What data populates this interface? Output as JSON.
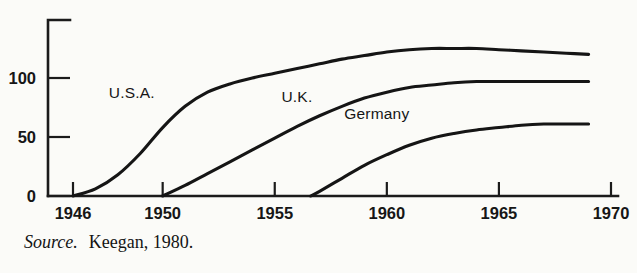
{
  "figure": {
    "source_note": {
      "label": "Source.",
      "citation": "Keegan, 1980."
    }
  },
  "chart_data": {
    "type": "line",
    "title": "",
    "xlabel": "",
    "ylabel": "",
    "xlim": [
      1946,
      1970
    ],
    "ylim": [
      0,
      130
    ],
    "xticks": [
      1946,
      1950,
      1955,
      1960,
      1965,
      1970
    ],
    "xticklabels": [
      "1946",
      "1950",
      "1955",
      "1960",
      "1965",
      "1970"
    ],
    "yticks": [
      0,
      50,
      100
    ],
    "yticklabels": [
      "0",
      "50",
      "100"
    ],
    "grid": false,
    "legend_position": "inline-labels",
    "colors": {
      "line": "#151515",
      "axis": "#1b1b1b",
      "background": "#fbfbf8"
    },
    "annotations": [
      {
        "text": "U.S.A.",
        "x": 1947.6,
        "y": 83
      },
      {
        "text": "U.K.",
        "x": 1955.3,
        "y": 80
      },
      {
        "text": "Germany",
        "x": 1958.1,
        "y": 65
      }
    ],
    "series": [
      {
        "name": "U.S.A.",
        "x": [
          1946,
          1947,
          1948,
          1949,
          1950,
          1951,
          1952,
          1953,
          1954,
          1955,
          1956,
          1957,
          1958,
          1959,
          1960,
          1961,
          1962,
          1963,
          1964,
          1965,
          1966,
          1967,
          1968,
          1969
        ],
        "values": [
          0,
          6,
          18,
          36,
          58,
          76,
          88,
          95,
          100,
          104,
          108,
          112,
          116,
          119,
          122,
          124,
          125,
          125,
          125,
          124,
          123,
          122,
          121,
          120
        ]
      },
      {
        "name": "U.K.",
        "x": [
          1950,
          1951,
          1952,
          1953,
          1954,
          1955,
          1956,
          1957,
          1958,
          1959,
          1960,
          1961,
          1962,
          1963,
          1964,
          1965,
          1966,
          1967,
          1968,
          1969
        ],
        "values": [
          0,
          9,
          19,
          29,
          39,
          49,
          59,
          68,
          76,
          83,
          88,
          92,
          94,
          96,
          97,
          97,
          97,
          97,
          97,
          97
        ]
      },
      {
        "name": "Germany",
        "x": [
          1956.6,
          1957,
          1958,
          1959,
          1960,
          1961,
          1962,
          1963,
          1964,
          1965,
          1966,
          1967,
          1968,
          1969
        ],
        "values": [
          0,
          4,
          15,
          26,
          35,
          43,
          49,
          53,
          56,
          58,
          60,
          61,
          61,
          61
        ]
      }
    ]
  }
}
